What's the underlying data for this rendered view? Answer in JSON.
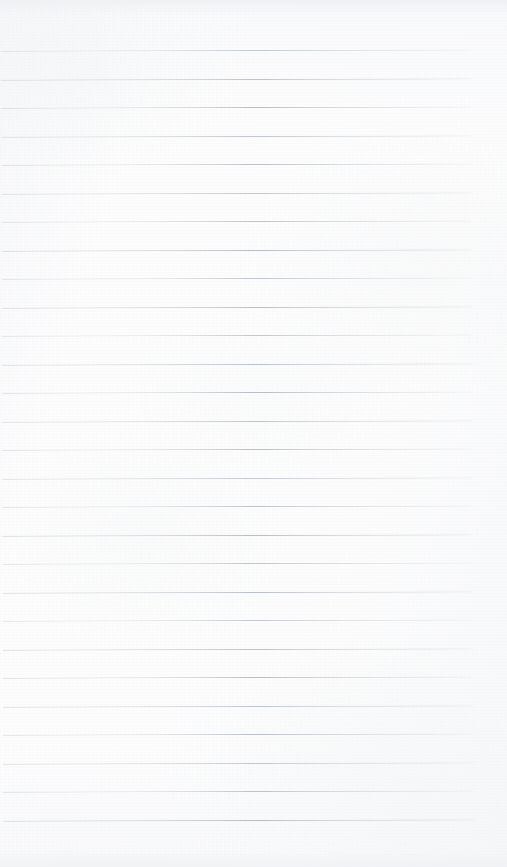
{
  "document": {
    "kind": "scanned-blank-ruled-notebook-page",
    "page_width": 507,
    "page_height": 867,
    "background_color": "#fdfdfd",
    "has_text": false,
    "has_handwriting": false,
    "has_margin_rule": false,
    "text_content": ""
  },
  "ruling": {
    "line_color": "#b6bdc5",
    "line_thickness": 1,
    "line_count": 28,
    "line_spacing": 28.5,
    "first_line_y": 50,
    "last_line_y": 819,
    "line_start_x": 2,
    "line_end_x": 473,
    "right_margin_width": 34,
    "skew_degrees": -0.16,
    "lines_y": [
      50,
      78.5,
      107,
      135.5,
      164,
      192.5,
      221,
      249.5,
      278,
      306.5,
      335,
      363.5,
      392,
      420.5,
      449,
      477.5,
      506,
      534.5,
      563,
      591.5,
      620,
      648.5,
      677,
      705.5,
      734,
      762.5,
      791,
      819.5
    ]
  },
  "margins": {
    "top_blank_height": 50,
    "bottom_blank_height": 47
  }
}
